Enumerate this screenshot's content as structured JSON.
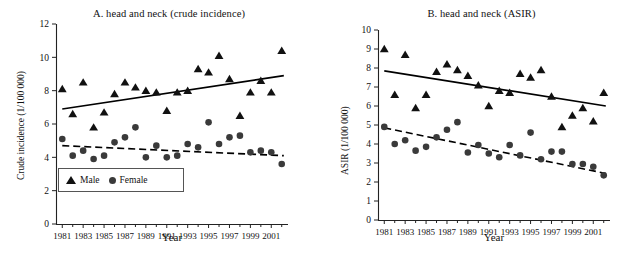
{
  "figure": {
    "xlabel": "Year",
    "legend": {
      "male": "Male",
      "female": "Female"
    }
  },
  "chart_data": [
    {
      "id": "A",
      "type": "scatter",
      "title": "A. head and neck (crude incidence)",
      "xlabel": "Year",
      "ylabel": "Crude incidence (1/100 000)",
      "xlim": [
        1980.4,
        2002.6
      ],
      "ylim": [
        0,
        12
      ],
      "yticks": [
        0,
        2,
        4,
        6,
        8,
        10,
        12
      ],
      "xticks": [
        1981,
        1983,
        1985,
        1987,
        1989,
        1991,
        1993,
        1995,
        1997,
        1999,
        2001
      ],
      "xtick_labels": [
        "1981",
        "1983",
        "1985",
        "1987",
        "1989",
        "1991",
        "1993",
        "1995",
        "1997",
        "1999",
        "2001"
      ],
      "grid": false,
      "legend_position": "lower-left",
      "x": [
        1981,
        1982,
        1983,
        1984,
        1985,
        1986,
        1987,
        1988,
        1989,
        1990,
        1991,
        1992,
        1993,
        1994,
        1995,
        1996,
        1997,
        1998,
        1999,
        2000,
        2001,
        2002
      ],
      "series": [
        {
          "name": "Male",
          "marker": "triangle",
          "values": [
            8.1,
            6.6,
            8.5,
            5.8,
            6.7,
            7.8,
            8.5,
            8.2,
            8.0,
            7.9,
            6.8,
            7.9,
            8.0,
            9.3,
            9.1,
            10.1,
            8.7,
            6.5,
            7.9,
            8.6,
            7.9,
            10.4
          ],
          "trend": {
            "type": "linear",
            "style": "solid",
            "x": [
              1981,
              2002.2
            ],
            "y": [
              6.9,
              8.9
            ]
          }
        },
        {
          "name": "Female",
          "marker": "circle",
          "values": [
            5.1,
            4.1,
            4.4,
            3.9,
            4.1,
            4.9,
            5.2,
            5.8,
            4.0,
            4.7,
            4.0,
            4.1,
            4.8,
            4.6,
            6.1,
            4.8,
            5.2,
            5.3,
            4.3,
            4.4,
            4.3,
            3.6
          ],
          "trend": {
            "type": "linear",
            "style": "dashed",
            "x": [
              1981,
              2002.2
            ],
            "y": [
              4.7,
              4.1
            ]
          }
        }
      ]
    },
    {
      "id": "B",
      "type": "scatter",
      "title": "B. head and neck (ASIR)",
      "xlabel": "Year",
      "ylabel": "ASIR (1/100 000)",
      "xlim": [
        1980.4,
        2002.6
      ],
      "ylim": [
        0,
        10
      ],
      "yticks": [
        0,
        1,
        2,
        3,
        4,
        5,
        6,
        7,
        8,
        9,
        10
      ],
      "xticks": [
        1981,
        1983,
        1985,
        1987,
        1989,
        1991,
        1993,
        1995,
        1997,
        1999,
        2001
      ],
      "xtick_labels": [
        "1981",
        "1983",
        "1985",
        "1987",
        "1989",
        "1991",
        "1993",
        "1995",
        "1997",
        "1999",
        "2001"
      ],
      "grid": false,
      "legend_position": "none",
      "x": [
        1981,
        1982,
        1983,
        1984,
        1985,
        1986,
        1987,
        1988,
        1989,
        1990,
        1991,
        1992,
        1993,
        1994,
        1995,
        1996,
        1997,
        1998,
        1999,
        2000,
        2001,
        2002
      ],
      "series": [
        {
          "name": "Male",
          "marker": "triangle",
          "values": [
            9.0,
            6.6,
            8.7,
            5.9,
            6.6,
            7.8,
            8.2,
            7.9,
            7.6,
            7.1,
            6.0,
            6.8,
            6.7,
            7.7,
            7.5,
            7.9,
            6.5,
            4.9,
            5.5,
            5.9,
            5.2,
            6.7
          ],
          "trend": {
            "type": "linear",
            "style": "solid",
            "x": [
              1981,
              2002.2
            ],
            "y": [
              7.85,
              6.0
            ]
          }
        },
        {
          "name": "Female",
          "marker": "circle",
          "values": [
            4.9,
            4.0,
            4.2,
            3.65,
            3.85,
            4.35,
            4.75,
            5.15,
            3.55,
            3.95,
            3.5,
            3.3,
            3.95,
            3.4,
            4.6,
            3.2,
            3.6,
            3.6,
            2.95,
            2.95,
            2.8,
            2.35
          ],
          "trend": {
            "type": "linear",
            "style": "dashed",
            "x": [
              1981,
              2002.2
            ],
            "y": [
              4.85,
              2.45
            ]
          }
        }
      ]
    }
  ]
}
